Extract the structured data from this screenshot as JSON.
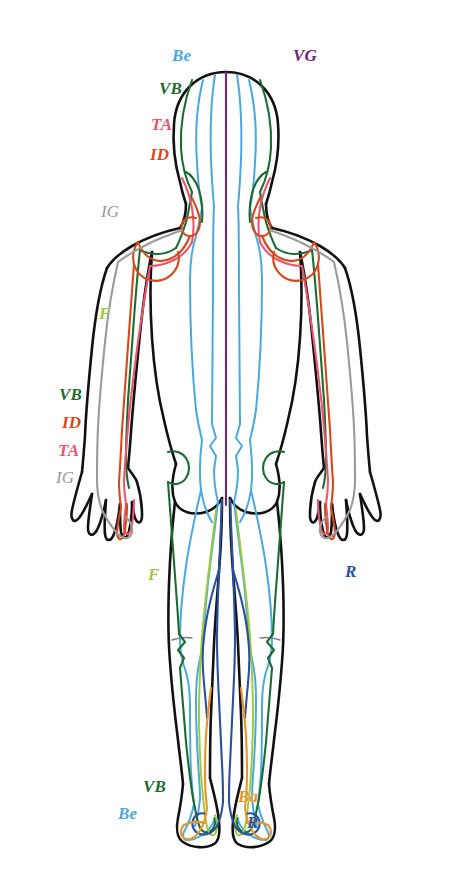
{
  "figure": {
    "view": "posterior",
    "outline_color": "#111111",
    "background_color": "#ffffff"
  },
  "meridian_colors": {
    "Be": "#4aa8e0",
    "VG": "#6b2a6b",
    "VB": "#1d6b33",
    "TA": "#e8566f",
    "ID": "#d4491c",
    "IG": "#9a9a98",
    "F": "#9ccb3b",
    "R": "#2a4f9e",
    "Ba": "#e8942a"
  },
  "labels": [
    {
      "id": "head-be",
      "text": "Be",
      "meridian": "Be",
      "color": "#4aa8e0",
      "x": 172,
      "y": 47,
      "weight": "bold"
    },
    {
      "id": "head-vg",
      "text": "VG",
      "meridian": "VG",
      "color": "#6b2a6b",
      "x": 293,
      "y": 47,
      "weight": "bold"
    },
    {
      "id": "head-vb",
      "text": "VB",
      "meridian": "VB",
      "color": "#1d6b33",
      "x": 159,
      "y": 80,
      "weight": "bold"
    },
    {
      "id": "head-ta",
      "text": "TA",
      "meridian": "TA",
      "color": "#e8566f",
      "x": 151,
      "y": 116,
      "weight": "bold"
    },
    {
      "id": "head-id",
      "text": "ID",
      "meridian": "ID",
      "color": "#d4491c",
      "x": 150,
      "y": 146,
      "weight": "bold"
    },
    {
      "id": "shoulder-ig",
      "text": "IG",
      "meridian": "IG",
      "color": "#9a9a98",
      "x": 101,
      "y": 203,
      "weight": "light"
    },
    {
      "id": "arm-f",
      "text": "F",
      "meridian": "F",
      "color": "#9ccb3b",
      "x": 99,
      "y": 305,
      "weight": "bold"
    },
    {
      "id": "arm-vb",
      "text": "VB",
      "meridian": "VB",
      "color": "#1d6b33",
      "x": 59,
      "y": 386,
      "weight": "bold"
    },
    {
      "id": "arm-id",
      "text": "ID",
      "meridian": "ID",
      "color": "#d4491c",
      "x": 62,
      "y": 414,
      "weight": "bold"
    },
    {
      "id": "arm-ta",
      "text": "TA",
      "meridian": "TA",
      "color": "#e8566f",
      "x": 58,
      "y": 442,
      "weight": "bold"
    },
    {
      "id": "arm-ig",
      "text": "IG",
      "meridian": "IG",
      "color": "#9a9a98",
      "x": 56,
      "y": 469,
      "weight": "light"
    },
    {
      "id": "leg-f",
      "text": "F",
      "meridian": "F",
      "color": "#9ccb3b",
      "x": 148,
      "y": 566,
      "weight": "bold"
    },
    {
      "id": "leg-r",
      "text": "R",
      "meridian": "R",
      "color": "#2a4f9e",
      "x": 345,
      "y": 563,
      "weight": "bold"
    },
    {
      "id": "foot-vb",
      "text": "VB",
      "meridian": "VB",
      "color": "#1d6b33",
      "x": 143,
      "y": 778,
      "weight": "bold"
    },
    {
      "id": "foot-be",
      "text": "Be",
      "meridian": "Be",
      "color": "#4aa8e0",
      "x": 118,
      "y": 805,
      "weight": "bold"
    },
    {
      "id": "foot-ba",
      "text": "Ba",
      "meridian": "Ba",
      "color": "#e8942a",
      "x": 238,
      "y": 788,
      "weight": "bold"
    },
    {
      "id": "foot-r",
      "text": "R",
      "meridian": "R",
      "color": "#2a4f9e",
      "x": 247,
      "y": 814,
      "weight": "bold"
    }
  ]
}
